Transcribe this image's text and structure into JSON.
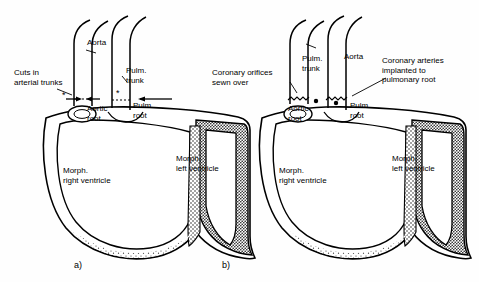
{
  "figure": {
    "title": "",
    "panels": [
      {
        "id": "a",
        "caption": "a)",
        "labels": [
          {
            "name": "aorta",
            "text": "Aorta"
          },
          {
            "name": "pulm-trunk",
            "text": "Pulm.\ntrunk"
          },
          {
            "name": "cuts-in-arterial-trunks",
            "text": "Cuts in\narterial trunks"
          },
          {
            "name": "aortic-root",
            "text": "Aortic\nroot"
          },
          {
            "name": "pulm-root",
            "text": "Pulm.\nroot"
          },
          {
            "name": "morph-right-ventricle",
            "text": "Morph.\nright ventricle"
          },
          {
            "name": "morph-left-ventricle",
            "text": "Morph.\nleft ventricle"
          }
        ]
      },
      {
        "id": "b",
        "caption": "b)",
        "labels": [
          {
            "name": "pulm-trunk",
            "text": "Pulm.\ntrunk"
          },
          {
            "name": "aorta",
            "text": "Aorta"
          },
          {
            "name": "coronary-orifices-sewn-over",
            "text": "Coronary orifices\nsewn over"
          },
          {
            "name": "coronary-arteries-implanted",
            "text": "Coronary arteries\nimplanted to\npulmonary root"
          },
          {
            "name": "aortic-root",
            "text": "Aortic\nroot"
          },
          {
            "name": "pulm-root",
            "text": "Pulm.\nroot"
          },
          {
            "name": "morph-right-ventricle",
            "text": "Morph.\nright ventricle"
          },
          {
            "name": "morph-left-ventricle",
            "text": "Morph.\nleft ventricle"
          }
        ]
      }
    ],
    "colors": {
      "ink": "#000000",
      "background": "#ffffff",
      "stipple": "#2b2b2b"
    }
  }
}
